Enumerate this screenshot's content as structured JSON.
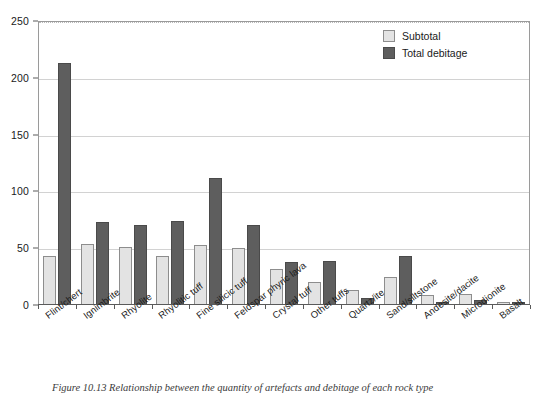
{
  "chart_data": {
    "type": "bar",
    "title": "",
    "xlabel": "",
    "ylabel": "",
    "ylim": [
      0,
      250
    ],
    "ytick_labels": [
      "0",
      "50",
      "100",
      "150",
      "200",
      "250"
    ],
    "yticks": [
      0,
      50,
      100,
      150,
      200,
      250
    ],
    "grid": true,
    "legend_position": "top-right",
    "categories": [
      "Flint/chert",
      "Ignimbrite",
      "Rhyolite",
      "Rhyolitic tuff",
      "Fine silicic tuff",
      "Feldspar phyric lava",
      "Crystal tuff",
      "Other tuffs",
      "Quartz/ite",
      "Sand/siltstone",
      "Andesite/dacite",
      "Microdionite",
      "Basalt"
    ],
    "series": [
      {
        "name": "Subtotal",
        "color": "#e3e3e3",
        "values": [
          43,
          54,
          51,
          43,
          53,
          50,
          32,
          20,
          13,
          25,
          9,
          10,
          3
        ]
      },
      {
        "name": "Total debitage",
        "color": "#5e5e5e",
        "values": [
          213,
          73,
          70,
          74,
          112,
          70,
          38,
          39,
          6,
          43,
          3,
          4,
          3
        ]
      }
    ]
  },
  "legend": {
    "items": [
      {
        "label": "Subtotal"
      },
      {
        "label": "Total debitage"
      }
    ]
  },
  "caption": {
    "text": "Figure 10.13  Relationship between the quantity of artefacts and debitage of each rock type"
  }
}
